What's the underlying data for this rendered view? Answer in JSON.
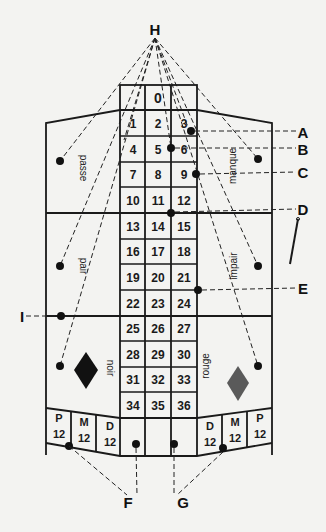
{
  "title_marker": "H",
  "zero": "0",
  "numbers": [
    [
      "1",
      "2",
      "3"
    ],
    [
      "4",
      "5",
      "6"
    ],
    [
      "7",
      "8",
      "9"
    ],
    [
      "10",
      "11",
      "12"
    ],
    [
      "13",
      "14",
      "15"
    ],
    [
      "16",
      "17",
      "18"
    ],
    [
      "19",
      "20",
      "21"
    ],
    [
      "22",
      "23",
      "24"
    ],
    [
      "25",
      "26",
      "27"
    ],
    [
      "28",
      "29",
      "30"
    ],
    [
      "31",
      "32",
      "33"
    ],
    [
      "34",
      "35",
      "36"
    ]
  ],
  "side_labels": {
    "passe": "passe",
    "manque": "manque",
    "pair": "pair",
    "impair": "impair",
    "noir": "noir",
    "rouge": "rouge"
  },
  "dozens_left": [
    {
      "letter": "P",
      "value": "12"
    },
    {
      "letter": "M",
      "value": "12"
    },
    {
      "letter": "D",
      "value": "12"
    }
  ],
  "dozens_right": [
    {
      "letter": "D",
      "value": "12"
    },
    {
      "letter": "M",
      "value": "12"
    },
    {
      "letter": "P",
      "value": "12"
    }
  ],
  "callouts": {
    "A": "A",
    "B": "B",
    "C": "C",
    "D": "D",
    "E": "E",
    "F": "F",
    "G": "G",
    "H": "H",
    "I": "I"
  },
  "colors": {
    "background": "#f3f3f1",
    "ink": "#1a1a1a",
    "noir_diamond": "#111111",
    "rouge_diamond": "#5a5a5a"
  }
}
